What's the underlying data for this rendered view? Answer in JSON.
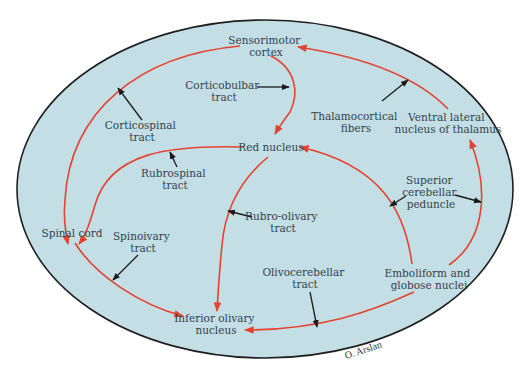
{
  "diagram": {
    "colors": {
      "background": "#ffffff",
      "ellipse_fill": "#c3dee4",
      "ellipse_stroke": "#1f1f1f",
      "pathway_arrow": "#e5432f",
      "pointer_arrow": "#1a1a1a",
      "text": "#34434f"
    },
    "nodes": {
      "sensorimotor_cortex": [
        "Sensorimotor",
        "cortex"
      ],
      "red_nucleus": [
        "Red nucleus"
      ],
      "spinal_cord": [
        "Spinal cord"
      ],
      "inferior_olivary_nucleus": [
        "Inferior olivary",
        "nucleus"
      ],
      "emboliform_globose": [
        "Emboliform and",
        "globose nuclei"
      ],
      "ventral_lateral_thalamus": [
        "Ventral lateral",
        "nucleus of thalamus"
      ]
    },
    "tracts": {
      "corticobulbar": [
        "Corticobulbar",
        "tract"
      ],
      "corticospinal": [
        "Corticospinal",
        "tract"
      ],
      "thalamocortical": [
        "Thalamocortical",
        "fibers"
      ],
      "rubrospinal": [
        "Rubrospinal",
        "tract"
      ],
      "superior_cerebellar_peduncle": [
        "Superior",
        "cerebellar",
        "peduncle"
      ],
      "rubro_olivary": [
        "Rubro-olivary",
        "tract"
      ],
      "spinoivary": [
        "Spinoivary",
        "tract"
      ],
      "olivocerebellar": [
        "Olivocerebellar",
        "tract"
      ]
    },
    "signature": "O. Arslan"
  }
}
